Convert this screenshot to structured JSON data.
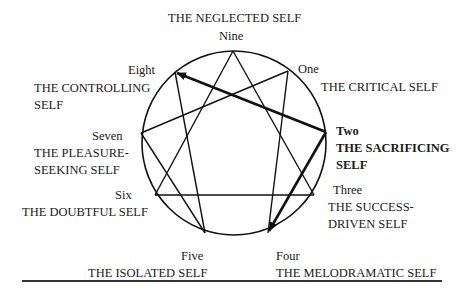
{
  "title": "THE NEGLECTED SELF",
  "points": {
    "nine": {
      "number": "Nine",
      "name": "THE NEGLECTED SELF"
    },
    "one": {
      "number": "One",
      "name": "THE CRITICAL SELF"
    },
    "two": {
      "number": "Two",
      "name_line1": "THE SACRIFICING",
      "name_line2": "SELF"
    },
    "three": {
      "number": "Three",
      "name_line1": "THE SUCCESS-",
      "name_line2": "DRIVEN SELF"
    },
    "four": {
      "number": "Four",
      "name": "THE MELODRAMATIC SELF"
    },
    "five": {
      "number": "Five",
      "name": "THE ISOLATED SELF"
    },
    "six": {
      "number": "Six",
      "name": "THE DOUBTFUL SELF"
    },
    "seven": {
      "number": "Seven",
      "name_line1": "THE PLEASURE-",
      "name_line2": "SEEKING SELF"
    },
    "eight": {
      "number": "Eight",
      "name_line1": "THE CONTROLLING",
      "name_line2": "SELF"
    }
  },
  "highlight": {
    "from": "Two",
    "arrows_to": [
      "Eight",
      "Four"
    ],
    "color": "#111111"
  }
}
